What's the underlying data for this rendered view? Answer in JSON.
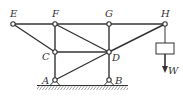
{
  "diagram": {
    "type": "truss",
    "nodes": [
      {
        "id": "E",
        "label": "E"
      },
      {
        "id": "F",
        "label": "F"
      },
      {
        "id": "G",
        "label": "G"
      },
      {
        "id": "H",
        "label": "H"
      },
      {
        "id": "C",
        "label": "C"
      },
      {
        "id": "D",
        "label": "D"
      },
      {
        "id": "A",
        "label": "A"
      },
      {
        "id": "B",
        "label": "B"
      }
    ],
    "members": [
      [
        "E",
        "F"
      ],
      [
        "F",
        "G"
      ],
      [
        "G",
        "H"
      ],
      [
        "E",
        "C"
      ],
      [
        "F",
        "C"
      ],
      [
        "C",
        "A"
      ],
      [
        "F",
        "D"
      ],
      [
        "C",
        "D"
      ],
      [
        "G",
        "D"
      ],
      [
        "D",
        "B"
      ],
      [
        "A",
        "D"
      ],
      [
        "D",
        "H"
      ]
    ],
    "supports": [
      "A",
      "B"
    ],
    "load": {
      "at": "H",
      "label": "W",
      "direction": "down"
    },
    "colors": {
      "line": "#333333",
      "background": "#ffffff"
    }
  }
}
